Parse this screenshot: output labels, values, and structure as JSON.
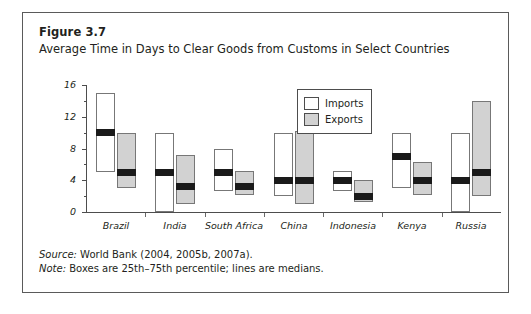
{
  "figure": {
    "number": "Figure 3.7",
    "title": "Average Time in Days to Clear Goods from Customs in Select Countries",
    "source_lead": "Source:",
    "source_text": " World Bank (2004, 2005b, 2007a).",
    "note_lead": "Note:",
    "note_text": " Boxes are 25th–75th percentile; lines are medians."
  },
  "legend": {
    "position": "top-right-inside",
    "entries": [
      {
        "label": "Imports",
        "color": "#ffffff",
        "swatch": "imports-swatch"
      },
      {
        "label": "Exports",
        "color": "#d2d2d2",
        "swatch": "exports-swatch"
      }
    ]
  },
  "chart_data": {
    "type": "bar",
    "subtype": "box-plot",
    "title": "Average Time in Days to Clear Goods from Customs in Select Countries",
    "xlabel": "",
    "ylabel": "",
    "ylim": [
      0,
      16
    ],
    "yticks": [
      0,
      4,
      8,
      12,
      16
    ],
    "ytick_labels": [
      "0",
      "4",
      "8",
      "12",
      "16"
    ],
    "y_minor_step": 2,
    "grid": false,
    "categories": [
      "Brazil",
      "India",
      "South Africa",
      "China",
      "Indonesia",
      "Kenya",
      "Russia"
    ],
    "series": [
      {
        "name": "Imports",
        "color": "#ffffff",
        "boxes": [
          {
            "category": "Brazil",
            "q1": 5.0,
            "median": 10.0,
            "q3": 15.0
          },
          {
            "category": "India",
            "q1": 0.0,
            "median": 5.0,
            "q3": 10.0
          },
          {
            "category": "South Africa",
            "q1": 2.7,
            "median": 5.0,
            "q3": 8.0
          },
          {
            "category": "China",
            "q1": 2.0,
            "median": 4.0,
            "q3": 10.0
          },
          {
            "category": "Indonesia",
            "q1": 2.7,
            "median": 4.0,
            "q3": 5.2
          },
          {
            "category": "Kenya",
            "q1": 3.0,
            "median": 7.0,
            "q3": 10.0
          },
          {
            "category": "Russia",
            "q1": 0.0,
            "median": 4.0,
            "q3": 10.0
          }
        ]
      },
      {
        "name": "Exports",
        "color": "#d2d2d2",
        "boxes": [
          {
            "category": "Brazil",
            "q1": 3.0,
            "median": 5.0,
            "q3": 10.0
          },
          {
            "category": "India",
            "q1": 1.0,
            "median": 3.2,
            "q3": 7.2
          },
          {
            "category": "South Africa",
            "q1": 2.2,
            "median": 3.2,
            "q3": 5.2
          },
          {
            "category": "China",
            "q1": 1.0,
            "median": 4.0,
            "q3": 10.2
          },
          {
            "category": "Indonesia",
            "q1": 1.2,
            "median": 2.0,
            "q3": 4.0
          },
          {
            "category": "Kenya",
            "q1": 2.2,
            "median": 4.0,
            "q3": 6.3
          },
          {
            "category": "Russia",
            "q1": 2.0,
            "median": 5.0,
            "q3": 14.0
          }
        ]
      }
    ]
  }
}
